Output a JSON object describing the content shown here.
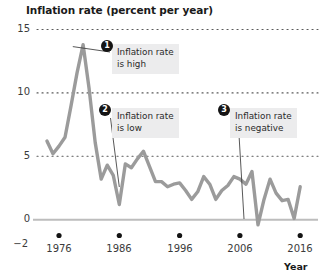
{
  "chart_data": {
    "type": "line",
    "title": "Inflation rate (percent per year)",
    "xlabel": "Year",
    "ylabel": "",
    "xlim": [
      1974,
      2017
    ],
    "ylim": [
      -2,
      15
    ],
    "grid": "horizontal-dotted",
    "legend": "none",
    "yticks": [
      15,
      10,
      5,
      0,
      -2
    ],
    "ytick_labels": [
      "15",
      "10",
      "5",
      "0",
      "−2"
    ],
    "xticks": [
      1976,
      1986,
      1996,
      2006,
      2016
    ],
    "xtick_labels": [
      "1976",
      "1986",
      "1996",
      "2006",
      "2016"
    ],
    "series": [
      {
        "name": "Inflation rate",
        "color": "#9b9b9b",
        "x": [
          1974,
          1975,
          1976,
          1977,
          1978,
          1979,
          1980,
          1981,
          1982,
          1983,
          1984,
          1985,
          1986,
          1987,
          1988,
          1989,
          1990,
          1991,
          1992,
          1993,
          1994,
          1995,
          1996,
          1997,
          1998,
          1999,
          2000,
          2001,
          2002,
          2003,
          2004,
          2005,
          2006,
          2007,
          2008,
          2009,
          2010,
          2011,
          2012,
          2013,
          2014,
          2015,
          2016
        ],
        "values": [
          6.2,
          5.2,
          5.8,
          6.5,
          9.0,
          11.6,
          13.8,
          10.3,
          6.1,
          3.2,
          4.3,
          3.5,
          1.2,
          4.4,
          4.1,
          4.8,
          5.4,
          4.2,
          3.0,
          3.0,
          2.6,
          2.8,
          2.9,
          2.3,
          1.6,
          2.2,
          3.4,
          2.8,
          1.6,
          2.3,
          2.7,
          3.4,
          3.2,
          2.8,
          3.8,
          -0.4,
          1.6,
          3.2,
          2.1,
          1.5,
          1.6,
          0.1,
          2.6
        ]
      }
    ],
    "annotations": [
      {
        "number": "1",
        "line1": "Inflation rate",
        "line2": "is high",
        "target_year": 1980,
        "target_value": 13.8
      },
      {
        "number": "2",
        "line1": "Inflation rate",
        "line2": "is low",
        "target_year": 1986,
        "target_value": 1.2
      },
      {
        "number": "3",
        "line1": "Inflation rate",
        "line2": "is negative",
        "target_year": 2009,
        "target_value": -0.4
      }
    ]
  }
}
